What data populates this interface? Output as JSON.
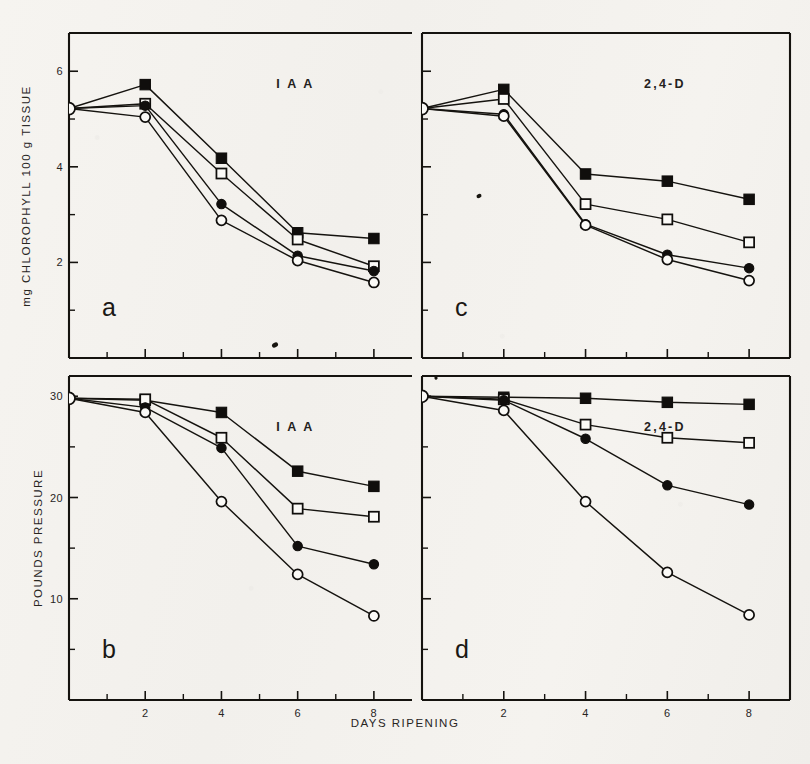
{
  "figure": {
    "background_color": "#f4f2ee",
    "ink_color": "#15130f",
    "x_axis_title": "DAYS RIPENING",
    "x_tick_labels": [
      "2",
      "4",
      "6",
      "8"
    ],
    "x_tick_values": [
      2,
      4,
      6,
      8
    ],
    "x_minor_tick_values": [
      1,
      3,
      5,
      7
    ],
    "x_range": [
      0,
      9
    ]
  },
  "panels": {
    "a": {
      "letter": "a",
      "title": "I A A"
    },
    "b": {
      "letter": "b",
      "title": "I A A"
    },
    "c": {
      "letter": "c",
      "title": "2,4-D"
    },
    "d": {
      "letter": "d",
      "title": "2,4-D"
    }
  },
  "axes": {
    "chlorophyll": {
      "label": "mg CHLOROPHYLL 100 g TISSUE",
      "tick_labels": [
        "6",
        "4",
        "2"
      ],
      "tick_values": [
        6,
        4,
        2
      ],
      "minor_tick_values": [
        5,
        3,
        1
      ],
      "range": [
        0,
        6.8
      ]
    },
    "pressure": {
      "label": "POUNDS PRESSURE",
      "tick_labels": [
        "30",
        "20",
        "10"
      ],
      "tick_values": [
        30,
        20,
        10
      ],
      "minor_tick_values": [
        25,
        15,
        5
      ],
      "range": [
        0,
        32
      ]
    }
  },
  "series_styles": [
    {
      "key": "filled_square",
      "marker": "filled-square"
    },
    {
      "key": "open_square",
      "marker": "open-square"
    },
    {
      "key": "filled_circle",
      "marker": "filled-circle"
    },
    {
      "key": "open_circle",
      "marker": "open-circle"
    }
  ],
  "chart_data": [
    {
      "type": "line",
      "panel": "a",
      "title": "I A A",
      "xlabel": "DAYS RIPENING",
      "ylabel": "mg CHLOROPHYLL 100 g TISSUE",
      "x": [
        0,
        2,
        4,
        6,
        8
      ],
      "xlim": [
        0,
        9
      ],
      "ylim": [
        0,
        6.8
      ],
      "grid": false,
      "legend": "none",
      "series": [
        {
          "name": "filled_square",
          "marker": "filled-square",
          "values": [
            5.22,
            5.72,
            4.18,
            2.62,
            2.5
          ]
        },
        {
          "name": "open_square",
          "marker": "open-square",
          "values": [
            5.22,
            5.32,
            3.86,
            2.48,
            1.92
          ]
        },
        {
          "name": "filled_circle",
          "marker": "filled-circle",
          "values": [
            5.22,
            5.28,
            3.22,
            2.14,
            1.82
          ]
        },
        {
          "name": "open_circle",
          "marker": "open-circle",
          "values": [
            5.22,
            5.04,
            2.88,
            2.04,
            1.58
          ]
        }
      ]
    },
    {
      "type": "line",
      "panel": "c",
      "title": "2,4-D",
      "xlabel": "DAYS RIPENING",
      "ylabel": "mg CHLOROPHYLL 100 g TISSUE",
      "x": [
        0,
        2,
        4,
        6,
        8
      ],
      "xlim": [
        0,
        9
      ],
      "ylim": [
        0,
        6.8
      ],
      "grid": false,
      "legend": "none",
      "series": [
        {
          "name": "filled_square",
          "marker": "filled-square",
          "values": [
            5.22,
            5.62,
            3.85,
            3.7,
            3.32
          ]
        },
        {
          "name": "open_square",
          "marker": "open-square",
          "values": [
            5.22,
            5.42,
            3.22,
            2.9,
            2.42
          ]
        },
        {
          "name": "filled_circle",
          "marker": "filled-circle",
          "values": [
            5.22,
            5.1,
            2.8,
            2.16,
            1.88
          ]
        },
        {
          "name": "open_circle",
          "marker": "open-circle",
          "values": [
            5.22,
            5.06,
            2.78,
            2.06,
            1.62
          ]
        }
      ]
    },
    {
      "type": "line",
      "panel": "b",
      "title": "I A A",
      "xlabel": "DAYS RIPENING",
      "ylabel": "POUNDS PRESSURE",
      "x": [
        0,
        2,
        4,
        6,
        8
      ],
      "xlim": [
        0,
        9
      ],
      "ylim": [
        0,
        32
      ],
      "grid": false,
      "legend": "none",
      "series": [
        {
          "name": "filled_square",
          "marker": "filled-square",
          "values": [
            29.8,
            29.6,
            28.4,
            22.6,
            21.1
          ]
        },
        {
          "name": "open_square",
          "marker": "open-square",
          "values": [
            29.8,
            29.7,
            25.9,
            18.9,
            18.1
          ]
        },
        {
          "name": "filled_circle",
          "marker": "filled-circle",
          "values": [
            29.8,
            28.9,
            24.9,
            15.2,
            13.4
          ]
        },
        {
          "name": "open_circle",
          "marker": "open-circle",
          "values": [
            29.8,
            28.4,
            19.6,
            12.4,
            8.3
          ]
        }
      ]
    },
    {
      "type": "line",
      "panel": "d",
      "title": "2,4-D",
      "xlabel": "DAYS RIPENING",
      "ylabel": "POUNDS PRESSURE",
      "x": [
        0,
        2,
        4,
        6,
        8
      ],
      "xlim": [
        0,
        9
      ],
      "ylim": [
        0,
        32
      ],
      "grid": false,
      "legend": "none",
      "series": [
        {
          "name": "filled_square",
          "marker": "filled-square",
          "values": [
            30.0,
            29.9,
            29.8,
            29.4,
            29.2
          ]
        },
        {
          "name": "open_square",
          "marker": "open-square",
          "values": [
            30.0,
            29.7,
            27.2,
            25.9,
            25.4
          ]
        },
        {
          "name": "filled_circle",
          "marker": "filled-circle",
          "values": [
            30.0,
            29.6,
            25.8,
            21.2,
            19.3
          ]
        },
        {
          "name": "open_circle",
          "marker": "open-circle",
          "values": [
            30.0,
            28.6,
            19.6,
            12.6,
            8.4
          ]
        }
      ]
    }
  ]
}
